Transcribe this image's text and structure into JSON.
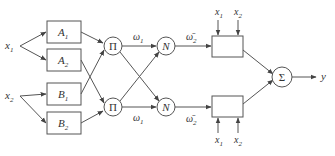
{
  "diagram": {
    "type": "ANFIS neuro-fuzzy network",
    "colors": {
      "stroke": "#555555",
      "text": "#333333",
      "background": "#ffffff"
    },
    "inputs": {
      "x1": {
        "base": "x",
        "sub": "1"
      },
      "x2": {
        "base": "x",
        "sub": "2"
      }
    },
    "layer1": {
      "A1": {
        "base": "A",
        "sub": "1"
      },
      "A2": {
        "base": "A",
        "sub": "2"
      },
      "B1": {
        "base": "B",
        "sub": "1"
      },
      "B2": {
        "base": "B",
        "sub": "2"
      }
    },
    "layer2": {
      "pi_top": "Π",
      "pi_bottom": "Π"
    },
    "layer2_outputs": {
      "top": {
        "base": "ω",
        "sub": "1"
      },
      "bottom": {
        "base": "ω",
        "sub": "1"
      }
    },
    "layer3": {
      "n_top": "N",
      "n_bottom": "N"
    },
    "layer3_outputs": {
      "top": {
        "base": "ω̄",
        "sub": "2"
      },
      "bottom": {
        "base": "ω̄",
        "sub": "2"
      }
    },
    "layer4": {
      "top_inputs": [
        {
          "base": "x",
          "sub": "1"
        },
        {
          "base": "x",
          "sub": "2"
        }
      ],
      "bottom_inputs": [
        {
          "base": "x",
          "sub": "1"
        },
        {
          "base": "x",
          "sub": "2"
        }
      ]
    },
    "layer5": {
      "sum": "Σ"
    },
    "output": {
      "label": "y"
    }
  }
}
